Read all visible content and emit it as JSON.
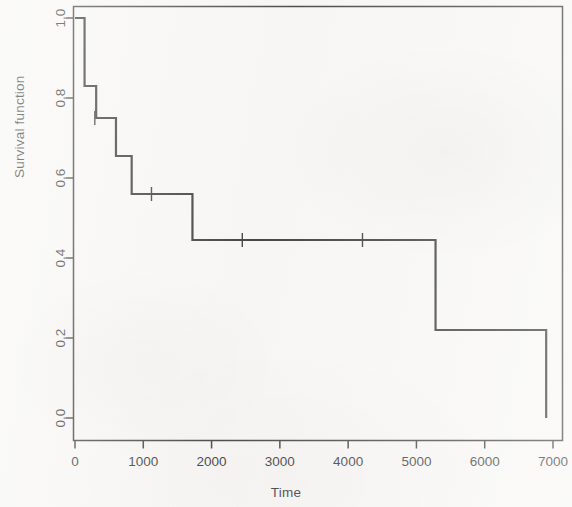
{
  "chart_data": {
    "type": "line",
    "subtype": "kaplan-meier-step",
    "title": "",
    "xlabel": "Time",
    "ylabel": "Survival function",
    "xlim": [
      -150,
      7150
    ],
    "ylim": [
      -0.045,
      1.045
    ],
    "grid": false,
    "legend": null,
    "xticks": [
      0,
      1000,
      2000,
      3000,
      4000,
      5000,
      6000,
      7000
    ],
    "xtick_labels": [
      "0",
      "1000",
      "2000",
      "3000",
      "4000",
      "5000",
      "6000",
      "7000"
    ],
    "yticks": [
      0.0,
      0.2,
      0.4,
      0.6,
      0.8,
      1.0
    ],
    "ytick_labels": [
      "0.0",
      "0.2",
      "0.4",
      "0.6",
      "0.8",
      "1.0"
    ],
    "line_color": "#1a1a1a",
    "line_width": 2.2,
    "box_frame": true,
    "series": [
      {
        "name": "Survival function",
        "step_type": "post",
        "x": [
          0,
          140,
          310,
          600,
          830,
          1720,
          5280,
          6900,
          6900
        ],
        "y": [
          1.0,
          0.83,
          0.75,
          0.655,
          0.56,
          0.445,
          0.22,
          0.22,
          0.0
        ]
      }
    ],
    "censoring_marks": [
      {
        "x": 290,
        "y": 0.75
      },
      {
        "x": 1120,
        "y": 0.56
      },
      {
        "x": 2450,
        "y": 0.445
      },
      {
        "x": 4210,
        "y": 0.445
      }
    ]
  }
}
